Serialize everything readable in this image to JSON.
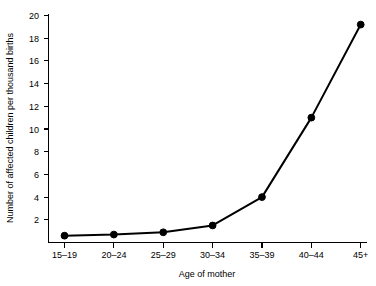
{
  "chart_data": {
    "type": "line",
    "title": "",
    "xlabel": "Age of mother",
    "ylabel": "Number of affected children per thousand births",
    "categories": [
      "15–19",
      "20–24",
      "25–29",
      "30–34",
      "35–39",
      "40–44",
      "45+"
    ],
    "values": [
      0.6,
      0.7,
      0.9,
      1.5,
      4.0,
      11.0,
      19.2
    ],
    "series": [
      {
        "name": "Affected children per thousand births",
        "values": [
          0.6,
          0.7,
          0.9,
          1.5,
          4.0,
          11.0,
          19.2
        ]
      }
    ],
    "ylim": [
      0,
      20
    ],
    "yticks": [
      2,
      4,
      6,
      8,
      10,
      12,
      14,
      16,
      18,
      20
    ],
    "ytick_labels": [
      "2",
      "4",
      "6",
      "8",
      "10",
      "12",
      "14",
      "16",
      "18",
      "20"
    ],
    "grid": false,
    "legend": "none",
    "marker": "filled-circle",
    "line_color": "#000000",
    "marker_color": "#000000",
    "background_color": "#ffffff"
  }
}
